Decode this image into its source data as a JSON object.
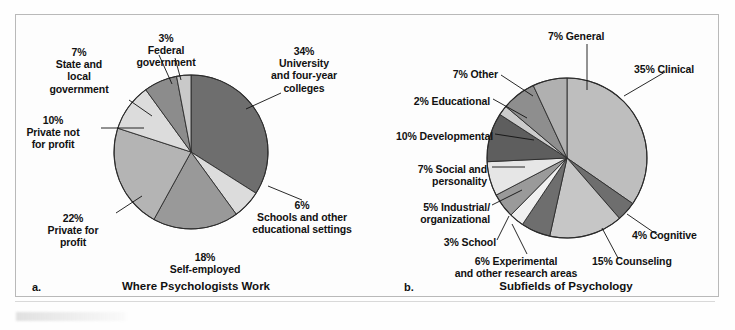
{
  "figure": {
    "background": "#fdfdfd",
    "border_color": "#b9b9b9"
  },
  "panel_a": {
    "letter": "a.",
    "title": "Where Psychologists Work",
    "labels": [
      {
        "id": "federal-government",
        "text": "3%\nFederal\ngovernment"
      },
      {
        "id": "state-local-government",
        "text": "7%\nState and\nlocal\ngovernment"
      },
      {
        "id": "private-not-for-profit",
        "text": "10%\nPrivate not\nfor profit"
      },
      {
        "id": "private-for-profit",
        "text": "22%\nPrivate for\nprofit"
      },
      {
        "id": "self-employed",
        "text": "18%\nSelf-employed"
      },
      {
        "id": "schools-other-educational",
        "text": "6%\nSchools and other\neducational settings"
      },
      {
        "id": "university-four-year-colleges",
        "text": "34%\nUniversity\nand four-year\ncolleges"
      }
    ]
  },
  "panel_b": {
    "letter": "b.",
    "title": "Subfields of Psychology",
    "labels": [
      {
        "id": "general",
        "text": "7% General"
      },
      {
        "id": "clinical",
        "text": "35% Clinical"
      },
      {
        "id": "cognitive",
        "text": "4% Cognitive"
      },
      {
        "id": "counseling",
        "text": "15% Counseling"
      },
      {
        "id": "experimental",
        "text": "6% Experimental\nand other research areas"
      },
      {
        "id": "school",
        "text": "3% School"
      },
      {
        "id": "industrial-organizational",
        "text": "5% Industrial/\norganizational"
      },
      {
        "id": "social-personality",
        "text": "7% Social and\npersonality"
      },
      {
        "id": "developmental",
        "text": "10% Developmental"
      },
      {
        "id": "educational",
        "text": "2% Educational"
      },
      {
        "id": "other",
        "text": "7% Other"
      }
    ]
  },
  "chart_data": [
    {
      "type": "pie",
      "id": "where-psychologists-work",
      "title": "Where Psychologists Work",
      "panel": "a.",
      "start_angle_deg": -90,
      "direction": "clockwise",
      "center": {
        "x": 191,
        "y": 152
      },
      "radius": 77,
      "categories": [
        "University and four-year colleges",
        "Schools and other educational settings",
        "Self-employed",
        "Private for profit",
        "Private not for profit",
        "State and local government",
        "Federal government"
      ],
      "values": [
        34,
        6,
        18,
        22,
        10,
        7,
        3
      ],
      "unit": "percent",
      "colors": [
        "#6e6e6e",
        "#dcdcdc",
        "#999999",
        "#b4b4b4",
        "#dcdcdc",
        "#8c8c8c",
        "#c9c9c9"
      ],
      "legend": "none",
      "grid": false
    },
    {
      "type": "pie",
      "id": "subfields-of-psychology",
      "title": "Subfields of Psychology",
      "panel": "b.",
      "start_angle_deg": -90,
      "direction": "clockwise",
      "center": {
        "x": 567,
        "y": 158
      },
      "radius": 80,
      "categories": [
        "Clinical",
        "Cognitive",
        "Counseling",
        "Experimental and other research areas",
        "School",
        "Industrial/organizational",
        "Social and personality",
        "Developmental",
        "Educational",
        "Other",
        "General"
      ],
      "values": [
        35,
        4,
        15,
        6,
        3,
        5,
        7,
        10,
        2,
        7,
        7
      ],
      "unit": "percent",
      "colors": [
        "#bebebe",
        "#6e6e6e",
        "#c6c6c6",
        "#6e6e6e",
        "#f0f0f0",
        "#9a9a9a",
        "#e6e6e6",
        "#5e5e5e",
        "#cccccc",
        "#8e8e8e",
        "#b0b0b0"
      ],
      "legend": "none",
      "grid": false
    }
  ]
}
